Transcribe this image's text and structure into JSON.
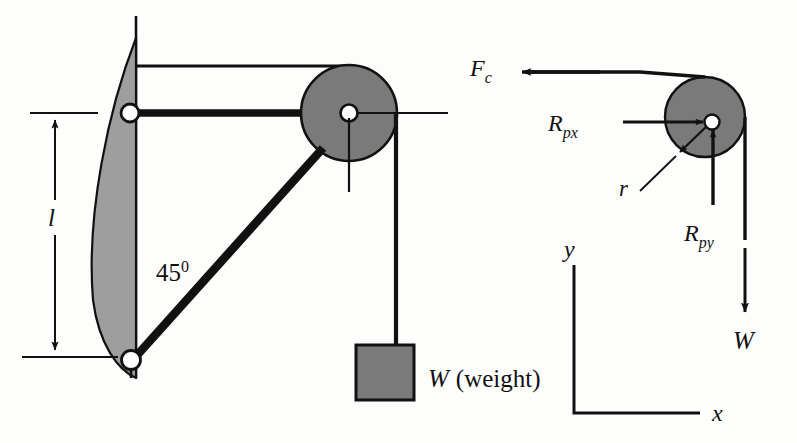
{
  "figure": {
    "colors": {
      "stroke": "#111111",
      "fill_gray": "#7a7a7a",
      "spring_gray": "#9e9e9e",
      "white": "#ffffff",
      "background": "#fdfdfc"
    }
  },
  "left_diagram": {
    "name": "mechanism-assembly",
    "labels": {
      "length_dimension": "l",
      "angle": "45",
      "angle_superscript": "0",
      "weight_block": "W (weight)",
      "weight_symbol": "W",
      "weight_parenthetical": "(weight)"
    },
    "parts": {
      "wall_label": "vertical-wall",
      "spring_label": "curved-spring-element",
      "top_pivot_label": "top-pivot-joint",
      "bottom_pivot_label": "bottom-pivot-joint",
      "horizontal_bar_label": "horizontal-link-bar",
      "diagonal_bar_label": "diagonal-link-bar",
      "pulley_label": "pulley-disc",
      "rope_label": "rope",
      "block_label": "hanging-weight-block"
    }
  },
  "right_diagram": {
    "name": "pulley-free-body-diagram",
    "forces": [
      {
        "id": "Fc",
        "base": "F",
        "sub": "c",
        "direction": "left",
        "description": "cable tension force acting leftward"
      },
      {
        "id": "Rpx",
        "base": "R",
        "sub": "px",
        "direction": "right",
        "description": "pin reaction force in x on the pulley"
      },
      {
        "id": "Rpy",
        "base": "R",
        "sub": "py",
        "direction": "up",
        "description": "pin reaction force in y on the pulley"
      },
      {
        "id": "W",
        "base": "W",
        "sub": "",
        "direction": "down",
        "description": "weight force pulling down the rope"
      }
    ],
    "radius_label": "r",
    "axes": {
      "vertical": "y",
      "horizontal": "x",
      "name": "coordinate-axes"
    }
  }
}
